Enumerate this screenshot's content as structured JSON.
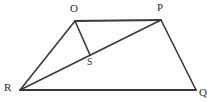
{
  "figure": {
    "type": "geometry-diagram",
    "background_color": "#fdfdfd",
    "stroke_color": "#3a3a3a",
    "label_color": "#2b2b2b",
    "width": 215,
    "height": 102,
    "vertices": [
      {
        "name": "O",
        "label": "O",
        "x": 75,
        "y": 21,
        "label_x": 70,
        "label_y": 3
      },
      {
        "name": "P",
        "label": "P",
        "x": 161,
        "y": 20,
        "label_x": 157,
        "label_y": 2
      },
      {
        "name": "Q",
        "label": "Q",
        "x": 196,
        "y": 90,
        "label_x": 199,
        "label_y": 87
      },
      {
        "name": "R",
        "label": "R",
        "x": 20,
        "y": 90,
        "label_x": 4,
        "label_y": 82
      },
      {
        "name": "S",
        "label": "S",
        "x": 90,
        "y": 55,
        "label_x": 87,
        "label_y": 58
      }
    ],
    "segments": [
      {
        "name": "segment-OP",
        "from": "O",
        "to": "P",
        "x1": 75,
        "y1": 21,
        "x2": 161,
        "y2": 20,
        "width": 2.0
      },
      {
        "name": "segment-PQ",
        "from": "P",
        "to": "Q",
        "x1": 161,
        "y1": 20,
        "x2": 196,
        "y2": 90,
        "width": 1.6
      },
      {
        "name": "segment-QR",
        "from": "Q",
        "to": "R",
        "x1": 196,
        "y1": 90,
        "x2": 20,
        "y2": 90,
        "width": 2.0
      },
      {
        "name": "segment-RO",
        "from": "R",
        "to": "O",
        "x1": 20,
        "y1": 90,
        "x2": 75,
        "y2": 21,
        "width": 1.6
      },
      {
        "name": "segment-RP-diagonal",
        "from": "R",
        "to": "P",
        "x1": 20,
        "y1": 90,
        "x2": 161,
        "y2": 20,
        "width": 1.6
      },
      {
        "name": "segment-OS-altitude",
        "from": "O",
        "to": "S",
        "x1": 75,
        "y1": 21,
        "x2": 90,
        "y2": 55,
        "width": 1.6
      }
    ]
  }
}
